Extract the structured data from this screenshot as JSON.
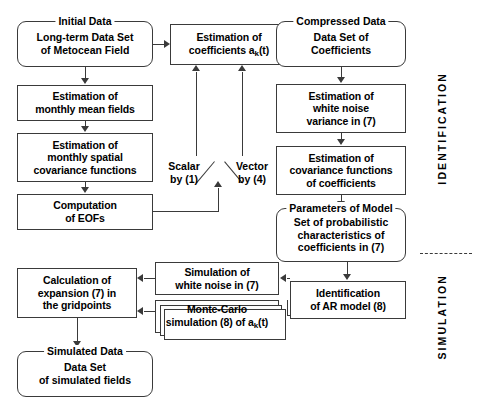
{
  "diagram": {
    "phases": [
      {
        "name": "identification",
        "label": "IDENTIFICATION"
      },
      {
        "name": "simulation",
        "label": "SIMULATION"
      }
    ],
    "nodes": {
      "initial_data": {
        "legend": "Initial Data",
        "lines": [
          "Long-term Data Set",
          "of Metocean Field"
        ]
      },
      "monthly_mean": {
        "lines": [
          "Estimation of",
          "monthly mean fields"
        ]
      },
      "monthly_spatial_cov": {
        "lines": [
          "Estimation of",
          "monthly spatial",
          "covariance functions"
        ]
      },
      "computation_eofs": {
        "lines": [
          "Computation",
          "of EOFs"
        ]
      },
      "estimation_coefficients": {
        "lines": [
          "Estimation of",
          "coefficients a_k(t)"
        ],
        "line2_prefix": "coefficients a",
        "line2_sub": "k",
        "line2_suffix": "(t)"
      },
      "compressed_data": {
        "legend": "Compressed Data",
        "lines": [
          "Data Set of",
          "Coefficients"
        ]
      },
      "white_noise_variance": {
        "lines": [
          "Estimation of",
          "white noise",
          "variance in (7)"
        ]
      },
      "covariance_functions_coeff": {
        "lines": [
          "Estimation of",
          "covariance functions",
          "of coefficients"
        ]
      },
      "parameters_of_model": {
        "legend": "Parameters of Model",
        "lines": [
          "Set of probabilistic",
          "characteristics of",
          "coefficients in (7)"
        ]
      },
      "identification_ar": {
        "lines": [
          "Identification",
          "of AR model (8)"
        ]
      },
      "simulation_white_noise": {
        "lines": [
          "Simulation of",
          "white noise in (7)"
        ]
      },
      "monte_carlo": {
        "lines": [
          "Monte-Carlo",
          "simulation (8) of a_k(t)"
        ],
        "line2_prefix": "simulation (8) of a",
        "line2_sub": "k",
        "line2_suffix": "(t)"
      },
      "calculation_expansion": {
        "lines": [
          "Calculation of",
          "expansion (7) in",
          "the gridpoints"
        ]
      },
      "simulated_data": {
        "legend": "Simulated Data",
        "lines": [
          "Data Set",
          "of simulated fields"
        ]
      }
    },
    "branch": {
      "left_label_line1": "Scalar",
      "left_label_line2": "by (1)",
      "right_label_line1": "Vector",
      "right_label_line2": "by (4)"
    },
    "colors": {
      "stroke": "#3a3a3a",
      "text": "#000000",
      "background": "#ffffff"
    }
  }
}
